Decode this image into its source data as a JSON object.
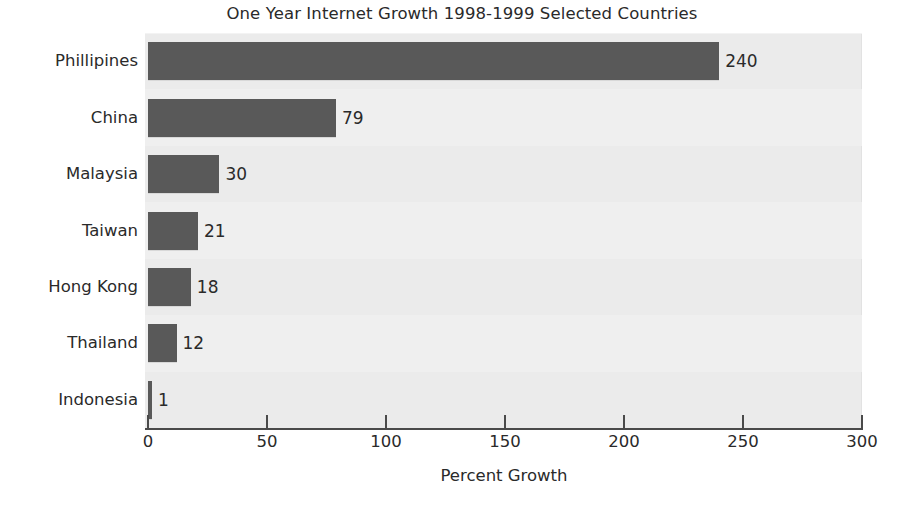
{
  "chart_data": {
    "type": "bar",
    "orientation": "horizontal",
    "title": "One Year Internet Growth 1998-1999 Selected Countries",
    "xlabel": "Percent Growth",
    "ylabel": "",
    "categories": [
      "Phillipines",
      "China",
      "Malaysia",
      "Taiwan",
      "Hong Kong",
      "Thailand",
      "Indonesia"
    ],
    "values": [
      240,
      79,
      30,
      21,
      18,
      12,
      1
    ],
    "value_labels": [
      "240",
      "79",
      "30",
      "21",
      "18",
      "12",
      "1"
    ],
    "xlim": [
      0,
      300
    ],
    "xticks": [
      0,
      50,
      100,
      150,
      200,
      250,
      300
    ],
    "xtick_labels": [
      "0",
      "50",
      "100",
      "150",
      "200",
      "250",
      "300"
    ],
    "grid": false,
    "legend": null,
    "colors": {
      "bar": "#595959",
      "plot_background": "#ebebeb",
      "figure_background": "#ffffff",
      "axis": "#4a4a4a",
      "text": "#2a2a2a"
    }
  }
}
